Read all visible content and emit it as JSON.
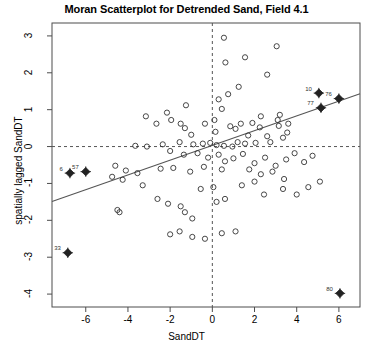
{
  "chart_data": {
    "type": "scatter",
    "title": "Moran Scatterplot for Detrended Sand, Field 4.1",
    "xlabel": "SandDT",
    "ylabel": "spatially lagged SandDT",
    "xlim": [
      -7.6,
      7.0
    ],
    "ylim": [
      -4.35,
      3.35
    ],
    "xticks": [
      -6,
      -4,
      -2,
      0,
      2,
      4,
      6
    ],
    "xticklabels": [
      "-6",
      "-4",
      "-2",
      "0",
      "2",
      "4",
      "6"
    ],
    "yticks": [
      -4,
      -3,
      -2,
      -1,
      0,
      1,
      2,
      3
    ],
    "yticklabels": [
      "-4",
      "-3",
      "-2",
      "-1",
      "0",
      "1",
      "2",
      "3"
    ],
    "grid": false,
    "legend": null,
    "reference_lines": [
      {
        "name": "vertical-zero-line",
        "orientation": "vertical",
        "value": 0,
        "style": "dashed"
      },
      {
        "name": "horizontal-zero-line",
        "orientation": "horizontal",
        "value": 0,
        "style": "dashed"
      }
    ],
    "regression_line": {
      "name": "moran-regression-line",
      "style": "solid",
      "slope": 0.2,
      "intercept": 0.03,
      "x_start": -7.6,
      "x_end": 7.0,
      "y_start": -1.49,
      "y_end": 1.43
    },
    "series": [
      {
        "name": "observations",
        "marker": "open-circle",
        "points": [
          [
            0.55,
            2.95
          ],
          [
            3.05,
            2.72
          ],
          [
            0.62,
            2.28
          ],
          [
            1.55,
            2.42
          ],
          [
            2.6,
            1.95
          ],
          [
            1.25,
            1.62
          ],
          [
            0.3,
            1.28
          ],
          [
            0.75,
            1.42
          ],
          [
            0.45,
            1.02
          ],
          [
            -1.25,
            1.12
          ],
          [
            -2.15,
            0.92
          ],
          [
            -3.15,
            0.82
          ],
          [
            -1.95,
            0.72
          ],
          [
            -2.65,
            0.62
          ],
          [
            -1.5,
            0.62
          ],
          [
            -1.3,
            0.5
          ],
          [
            -1.0,
            0.32
          ],
          [
            -0.35,
            0.62
          ],
          [
            0.1,
            0.72
          ],
          [
            0.15,
            0.4
          ],
          [
            0.85,
            0.55
          ],
          [
            1.1,
            0.48
          ],
          [
            1.35,
            0.62
          ],
          [
            1.9,
            0.64
          ],
          [
            2.25,
            0.52
          ],
          [
            2.3,
            0.82
          ],
          [
            1.7,
            0.3
          ],
          [
            2.6,
            0.28
          ],
          [
            3.1,
            0.72
          ],
          [
            3.15,
            0.56
          ],
          [
            3.2,
            0.86
          ],
          [
            3.55,
            0.38
          ],
          [
            3.6,
            0.62
          ],
          [
            3.35,
            0.24
          ],
          [
            2.75,
            0.12
          ],
          [
            2.05,
            0.1
          ],
          [
            1.55,
            0.08
          ],
          [
            1.2,
            0.12
          ],
          [
            0.95,
            0.0
          ],
          [
            0.55,
            0.02
          ],
          [
            0.2,
            0.04
          ],
          [
            -0.1,
            0.1
          ],
          [
            -0.45,
            0.08
          ],
          [
            -0.9,
            0.06
          ],
          [
            -1.55,
            0.12
          ],
          [
            -2.35,
            0.06
          ],
          [
            -3.1,
            0.0
          ],
          [
            -3.65,
            0.02
          ],
          [
            -2.0,
            -0.12
          ],
          [
            -1.35,
            -0.22
          ],
          [
            -0.7,
            -0.18
          ],
          [
            -0.2,
            -0.3
          ],
          [
            0.3,
            -0.22
          ],
          [
            0.6,
            -0.4
          ],
          [
            1.0,
            -0.32
          ],
          [
            1.45,
            -0.2
          ],
          [
            2.0,
            -0.45
          ],
          [
            2.5,
            -0.3
          ],
          [
            3.0,
            -0.52
          ],
          [
            3.5,
            -0.35
          ],
          [
            3.9,
            -0.18
          ],
          [
            4.35,
            -0.42
          ],
          [
            4.75,
            -0.25
          ],
          [
            1.75,
            -0.62
          ],
          [
            2.3,
            -0.75
          ],
          [
            2.85,
            -0.68
          ],
          [
            3.4,
            -0.88
          ],
          [
            0.45,
            -0.62
          ],
          [
            -0.4,
            -0.55
          ],
          [
            -1.05,
            -0.68
          ],
          [
            -1.85,
            -0.58
          ],
          [
            -2.45,
            -0.6
          ],
          [
            -3.55,
            -0.72
          ],
          [
            -4.1,
            -0.65
          ],
          [
            -4.6,
            -0.52
          ],
          [
            -4.25,
            -0.9
          ],
          [
            -4.75,
            -0.82
          ],
          [
            -3.3,
            -1.05
          ],
          [
            -2.6,
            -1.42
          ],
          [
            -2.1,
            -1.55
          ],
          [
            -1.5,
            -1.62
          ],
          [
            -1.3,
            -1.78
          ],
          [
            -0.95,
            -1.95
          ],
          [
            0.2,
            -1.5
          ],
          [
            0.6,
            -1.42
          ],
          [
            -4.5,
            -1.72
          ],
          [
            -4.4,
            -1.78
          ],
          [
            -2.0,
            -2.38
          ],
          [
            -1.55,
            -2.3
          ],
          [
            -0.95,
            -2.45
          ],
          [
            -0.35,
            -2.5
          ],
          [
            0.45,
            -2.35
          ],
          [
            1.1,
            -2.3
          ],
          [
            2.45,
            -1.3
          ],
          [
            3.35,
            -1.15
          ],
          [
            4.0,
            -1.3
          ],
          [
            4.55,
            -1.1
          ],
          [
            5.1,
            -0.95
          ],
          [
            0.05,
            -1.1
          ],
          [
            -0.55,
            -1.15
          ],
          [
            1.4,
            -1.05
          ],
          [
            2.0,
            -0.95
          ]
        ]
      },
      {
        "name": "influential-observations",
        "marker": "filled-diamond-cross",
        "points": [
          {
            "label": "6",
            "x": -6.75,
            "y": -0.72
          },
          {
            "label": "57",
            "x": -6.0,
            "y": -0.68
          },
          {
            "label": "33",
            "x": -6.85,
            "y": -2.88
          },
          {
            "label": "10",
            "x": 5.05,
            "y": 1.45
          },
          {
            "label": "76",
            "x": 6.0,
            "y": 1.3
          },
          {
            "label": "77",
            "x": 5.15,
            "y": 1.05
          },
          {
            "label": "80",
            "x": 6.05,
            "y": -3.98
          }
        ]
      }
    ]
  }
}
